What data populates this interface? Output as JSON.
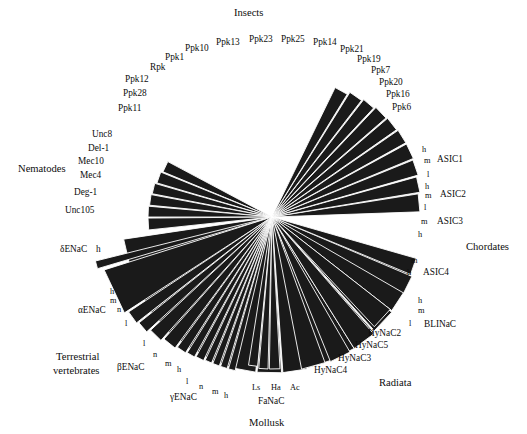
{
  "figure": {
    "type": "radial-phylogenetic-tree",
    "background_color": "#ffffff",
    "wedge_color": "#1a1a1a",
    "wedge_edge_color": "#ffffff",
    "center": {
      "x": 272,
      "y": 217
    }
  },
  "group_labels": [
    {
      "id": "insects",
      "text": "Insects",
      "x": 234,
      "y": 8
    },
    {
      "id": "nematodes",
      "text": "Nematodes",
      "x": 18,
      "y": 164
    },
    {
      "id": "chordates",
      "text": "Chordates",
      "x": 466,
      "y": 242
    },
    {
      "id": "radiata",
      "text": "Radiata",
      "x": 379,
      "y": 378
    },
    {
      "id": "mollusk",
      "text": "Mollusk",
      "x": 249,
      "y": 418
    },
    {
      "id": "terrestrial-1",
      "text": "Terrestrial",
      "x": 56,
      "y": 352
    },
    {
      "id": "terrestrial-2",
      "text": "vertebrates",
      "x": 53,
      "y": 366
    }
  ],
  "clades": [
    {
      "name": "Insects",
      "start_angle": 188,
      "end_angle": 352,
      "radius": 152,
      "leaves": [
        "Ppk11",
        "Ppk28",
        "Ppk12",
        "Rpk",
        "Ppk1",
        "Ppk10",
        "Ppk13",
        "Ppk23",
        "Ppk25",
        "Ppk14",
        "Ppk21",
        "Ppk19",
        "Ppk7",
        "Ppk20",
        "Ppk16",
        "Ppk6"
      ],
      "leaf_label_positions": [
        {
          "text": "Ppk11",
          "x": 118,
          "y": 104
        },
        {
          "text": "Ppk28",
          "x": 123,
          "y": 89
        },
        {
          "text": "Ppk12",
          "x": 125,
          "y": 75
        },
        {
          "text": "Rpk",
          "x": 150,
          "y": 63
        },
        {
          "text": "Ppk1",
          "x": 165,
          "y": 53
        },
        {
          "text": "Ppk10",
          "x": 185,
          "y": 44
        },
        {
          "text": "Ppk13",
          "x": 216,
          "y": 38
        },
        {
          "text": "Ppk23",
          "x": 249,
          "y": 35
        },
        {
          "text": "Ppk25",
          "x": 281,
          "y": 35
        },
        {
          "text": "Ppk14",
          "x": 313,
          "y": 38
        },
        {
          "text": "Ppk21",
          "x": 340,
          "y": 45
        },
        {
          "text": "Ppk19",
          "x": 357,
          "y": 55
        },
        {
          "text": "Ppk7",
          "x": 371,
          "y": 66
        },
        {
          "text": "Ppk20",
          "x": 379,
          "y": 78
        },
        {
          "text": "Ppk16",
          "x": 386,
          "y": 90
        },
        {
          "text": "Ppk6",
          "x": 392,
          "y": 103
        }
      ]
    },
    {
      "name": "Nematodes",
      "start_angle": 152,
      "end_angle": 186,
      "radius": 122,
      "leaves": [
        "Unc8",
        "Del-1",
        "Mec10",
        "Mec4",
        "Deg-1",
        "Unc105"
      ],
      "leaf_label_positions": [
        {
          "text": "Unc8",
          "x": 92,
          "y": 130
        },
        {
          "text": "Del-1",
          "x": 88,
          "y": 144
        },
        {
          "text": "Mec10",
          "x": 78,
          "y": 157
        },
        {
          "text": "Mec4",
          "x": 80,
          "y": 171
        },
        {
          "text": "Deg-1",
          "x": 74,
          "y": 188
        },
        {
          "text": "Unc105",
          "x": 65,
          "y": 206
        }
      ]
    },
    {
      "name": "Terrestrial vertebrates",
      "start_angle": 194,
      "end_angle": 256,
      "radius": 148,
      "subgroups": [
        {
          "name": "δENaC",
          "species": [
            "h"
          ]
        },
        {
          "name": "αENaC",
          "species": [
            "h",
            "m",
            "n",
            "l"
          ]
        },
        {
          "name": "βENaC",
          "species": [
            "l",
            "n",
            "m",
            "h"
          ]
        },
        {
          "name": "γENaC",
          "species": [
            "l",
            "n",
            "m",
            "h"
          ]
        }
      ],
      "leaf_label_positions": [
        {
          "text": "δENaC",
          "x": 60,
          "y": 245,
          "size": "leaf"
        },
        {
          "text": "h",
          "x": 96,
          "y": 245,
          "size": "leaf"
        },
        {
          "text": "h",
          "x": 110,
          "y": 288,
          "size": "sub"
        },
        {
          "text": "m",
          "x": 110,
          "y": 297,
          "size": "sub"
        },
        {
          "text": "αENaC",
          "x": 78,
          "y": 306,
          "size": "leaf"
        },
        {
          "text": "n",
          "x": 117,
          "y": 306,
          "size": "sub"
        },
        {
          "text": "l",
          "x": 125,
          "y": 320,
          "size": "sub"
        },
        {
          "text": "l",
          "x": 143,
          "y": 340,
          "size": "sub"
        },
        {
          "text": "n",
          "x": 153,
          "y": 351,
          "size": "sub"
        },
        {
          "text": "m",
          "x": 165,
          "y": 360,
          "size": "sub"
        },
        {
          "text": "βENaC",
          "x": 117,
          "y": 363,
          "size": "leaf"
        },
        {
          "text": "h",
          "x": 177,
          "y": 366,
          "size": "sub"
        },
        {
          "text": "l",
          "x": 186,
          "y": 378,
          "size": "sub"
        },
        {
          "text": "n",
          "x": 199,
          "y": 383,
          "size": "sub"
        },
        {
          "text": "m",
          "x": 212,
          "y": 388,
          "size": "sub"
        },
        {
          "text": "h",
          "x": 224,
          "y": 392,
          "size": "sub"
        },
        {
          "text": "γENaC",
          "x": 170,
          "y": 393,
          "size": "leaf"
        }
      ]
    },
    {
      "name": "Mollusk",
      "start_angle": 261,
      "end_angle": 273,
      "radius": 150,
      "subgroups": [
        {
          "name": "FaNaC",
          "species": [
            "Ls",
            "Ha",
            "Ac"
          ]
        }
      ],
      "leaf_label_positions": [
        {
          "text": "Ls",
          "x": 252,
          "y": 384,
          "size": "sub"
        },
        {
          "text": "Ha",
          "x": 271,
          "y": 384,
          "size": "sub"
        },
        {
          "text": "Ac",
          "x": 290,
          "y": 384,
          "size": "sub"
        },
        {
          "text": "FaNaC",
          "x": 258,
          "y": 397,
          "size": "leaf"
        }
      ]
    },
    {
      "name": "Radiata",
      "start_angle": 281,
      "end_angle": 332,
      "radius": 152,
      "leaves": [
        "HyNaC4",
        "HyNaC3",
        "HyNaC5",
        "HyNaC2"
      ],
      "leaf_label_positions": [
        {
          "text": "HyNaC4",
          "x": 314,
          "y": 366
        },
        {
          "text": "HyNaC3",
          "x": 338,
          "y": 354
        },
        {
          "text": "HyNaC5",
          "x": 355,
          "y": 341
        },
        {
          "text": "HyNaC2",
          "x": 368,
          "y": 329
        }
      ]
    },
    {
      "name": "BLINaC",
      "start_angle": 330,
      "end_angle": 344,
      "radius": 152,
      "subgroups": [
        {
          "name": "BLINaC",
          "species": [
            "h",
            "m",
            "l"
          ]
        }
      ],
      "leaf_label_positions": [
        {
          "text": "h",
          "x": 418,
          "y": 297,
          "size": "sub"
        },
        {
          "text": "m",
          "x": 418,
          "y": 307,
          "size": "sub"
        },
        {
          "text": "l",
          "x": 409,
          "y": 320,
          "size": "sub"
        },
        {
          "text": "BLINaC",
          "x": 424,
          "y": 320,
          "size": "leaf"
        }
      ]
    },
    {
      "name": "Chordates",
      "start_angle": 2,
      "end_angle": 64,
      "radius": 150,
      "subgroups": [
        {
          "name": "ASIC1",
          "species": [
            "h",
            "m",
            "l"
          ]
        },
        {
          "name": "ASIC2",
          "species": [
            "h",
            "m",
            "l"
          ]
        },
        {
          "name": "ASIC3",
          "species": [
            "m",
            "h"
          ]
        },
        {
          "name": "ASIC4",
          "species": [
            "m",
            "h"
          ]
        }
      ],
      "leaf_label_positions": [
        {
          "text": "h",
          "x": 422,
          "y": 146,
          "size": "sub"
        },
        {
          "text": "m",
          "x": 424,
          "y": 157,
          "size": "sub"
        },
        {
          "text": "ASIC1",
          "x": 437,
          "y": 155,
          "size": "leaf"
        },
        {
          "text": "l",
          "x": 427,
          "y": 171,
          "size": "sub"
        },
        {
          "text": "h",
          "x": 425,
          "y": 183,
          "size": "sub"
        },
        {
          "text": "m",
          "x": 425,
          "y": 192,
          "size": "sub"
        },
        {
          "text": "ASIC2",
          "x": 440,
          "y": 190,
          "size": "leaf"
        },
        {
          "text": "l",
          "x": 424,
          "y": 204,
          "size": "sub"
        },
        {
          "text": "m",
          "x": 421,
          "y": 218,
          "size": "sub"
        },
        {
          "text": "ASIC3",
          "x": 437,
          "y": 217,
          "size": "leaf"
        },
        {
          "text": "h",
          "x": 418,
          "y": 231,
          "size": "sub"
        },
        {
          "text": "m",
          "x": 411,
          "y": 257,
          "size": "sub"
        },
        {
          "text": "h",
          "x": 407,
          "y": 269,
          "size": "sub"
        },
        {
          "text": "ASIC4",
          "x": 423,
          "y": 268,
          "size": "leaf"
        }
      ]
    }
  ],
  "wedge_geometry": {
    "insects": [
      {
        "a0": 188.5,
        "a1": 198.0,
        "r": 150
      },
      {
        "a0": 198.5,
        "a1": 207.5,
        "r": 152
      },
      {
        "a0": 208.0,
        "a1": 217.5,
        "r": 153
      },
      {
        "a0": 218.0,
        "a1": 227.0,
        "r": 154
      },
      {
        "a0": 227.5,
        "a1": 236.5,
        "r": 155
      },
      {
        "a0": 237.0,
        "a1": 246.0,
        "r": 155
      },
      {
        "a0": 246.5,
        "a1": 255.0,
        "r": 156
      },
      {
        "a0": 255.5,
        "a1": 264.0,
        "r": 156
      },
      {
        "a0": 264.5,
        "a1": 273.5,
        "r": 156
      },
      {
        "a0": 274.0,
        "a1": 283.0,
        "r": 156
      },
      {
        "a0": 283.5,
        "a1": 292.5,
        "r": 155
      },
      {
        "a0": 293.0,
        "a1": 302.0,
        "r": 155
      },
      {
        "a0": 302.5,
        "a1": 311.5,
        "r": 154
      },
      {
        "a0": 312.0,
        "a1": 321.5,
        "r": 153
      },
      {
        "a0": 322.0,
        "a1": 331.5,
        "r": 152
      },
      {
        "a0": 332.0,
        "a1": 341.5,
        "r": 150
      }
    ],
    "nematodes": [
      {
        "a0": 152.0,
        "a1": 157.5,
        "r": 118
      },
      {
        "a0": 158.0,
        "a1": 163.5,
        "r": 120
      },
      {
        "a0": 164.0,
        "a1": 169.0,
        "r": 122
      },
      {
        "a0": 169.5,
        "a1": 174.5,
        "r": 123
      },
      {
        "a0": 175.0,
        "a1": 180.0,
        "r": 124
      },
      {
        "a0": 180.5,
        "a1": 186.0,
        "r": 124
      }
    ],
    "terrestrial": [
      {
        "a0": 194.0,
        "a1": 196.5,
        "r": 182
      },
      {
        "a0": 197.5,
        "a1": 213.0,
        "r": 176
      },
      {
        "a0": 213.5,
        "a1": 218.0,
        "r": 172
      },
      {
        "a0": 218.5,
        "a1": 222.5,
        "r": 170
      },
      {
        "a0": 223.0,
        "a1": 228.0,
        "r": 166
      },
      {
        "a0": 228.5,
        "a1": 233.5,
        "r": 163
      },
      {
        "a0": 234.0,
        "a1": 237.5,
        "r": 161
      },
      {
        "a0": 238.0,
        "a1": 241.0,
        "r": 160
      },
      {
        "a0": 241.5,
        "a1": 244.5,
        "r": 159
      },
      {
        "a0": 245.0,
        "a1": 247.5,
        "r": 158
      },
      {
        "a0": 248.0,
        "a1": 250.5,
        "r": 158
      },
      {
        "a0": 251.0,
        "a1": 253.5,
        "r": 158
      },
      {
        "a0": 254.0,
        "a1": 256.5,
        "r": 158
      }
    ],
    "mollusk": [
      {
        "a0": 261.0,
        "a1": 264.5,
        "r": 150
      },
      {
        "a0": 265.0,
        "a1": 268.5,
        "r": 152
      },
      {
        "a0": 269.0,
        "a1": 273.0,
        "r": 152
      }
    ],
    "radiata": [
      {
        "a0": 281.0,
        "a1": 290.0,
        "r": 155
      },
      {
        "a0": 292.0,
        "a1": 300.0,
        "r": 156
      },
      {
        "a0": 302.0,
        "a1": 311.0,
        "r": 155
      },
      {
        "a0": 313.0,
        "a1": 322.0,
        "r": 150
      }
    ],
    "blinac": [
      {
        "a0": 330.0,
        "a1": 337.0,
        "r": 152
      },
      {
        "a0": 337.5,
        "a1": 344.0,
        "r": 150
      }
    ],
    "chordates": [
      {
        "a0": 2.0,
        "a1": 9.0,
        "r": 148
      },
      {
        "a0": 9.5,
        "a1": 15.5,
        "r": 150
      },
      {
        "a0": 16.0,
        "a1": 22.0,
        "r": 152
      },
      {
        "a0": 22.5,
        "a1": 28.5,
        "r": 153
      },
      {
        "a0": 29.0,
        "a1": 34.5,
        "r": 153
      },
      {
        "a0": 35.0,
        "a1": 40.5,
        "r": 152
      },
      {
        "a0": 41.0,
        "a1": 46.5,
        "r": 151
      },
      {
        "a0": 47.0,
        "a1": 52.0,
        "r": 149
      },
      {
        "a0": 52.5,
        "a1": 58.0,
        "r": 147
      },
      {
        "a0": 58.5,
        "a1": 64.0,
        "r": 144
      }
    ]
  }
}
